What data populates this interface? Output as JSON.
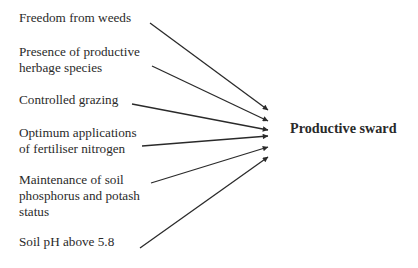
{
  "diagram": {
    "type": "influence-diagram",
    "outcome": {
      "label": "Productive sward"
    },
    "factors": [
      {
        "lines": [
          "Freedom from weeds"
        ]
      },
      {
        "lines": [
          "Presence of productive",
          "herbage species"
        ]
      },
      {
        "lines": [
          "Controlled grazing"
        ]
      },
      {
        "lines": [
          "Optimum applications",
          "of fertiliser nitrogen"
        ]
      },
      {
        "lines": [
          "Maintenance of soil",
          "phosphorus and potash",
          "status"
        ]
      },
      {
        "lines": [
          "Soil pH above 5.8"
        ]
      }
    ],
    "arrows": [
      {
        "from": "Freedom from weeds",
        "to": "Productive sward"
      },
      {
        "from": "Presence of productive herbage species",
        "to": "Productive sward"
      },
      {
        "from": "Controlled grazing",
        "to": "Productive sward"
      },
      {
        "from": "Optimum applications of fertiliser nitrogen",
        "to": "Productive sward"
      },
      {
        "from": "Maintenance of soil phosphorus and potash status",
        "to": "Productive sward"
      },
      {
        "from": "Soil pH above 5.8",
        "to": "Productive sward"
      }
    ],
    "colors": {
      "text": "#2a2a2a",
      "arrow": "#2a2a2a",
      "background": "#ffffff"
    }
  }
}
